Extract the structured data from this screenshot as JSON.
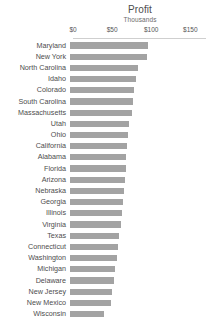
{
  "chart_data": {
    "type": "bar",
    "orientation": "horizontal",
    "title": "Profit",
    "subtitle": "Thousands",
    "xlabel": "",
    "ylabel": "",
    "xlim": [
      0,
      170
    ],
    "grid": false,
    "legend": null,
    "bar_color": "#a3a3a3",
    "axis_tick_labels": [
      "$0",
      "$50",
      "$100",
      "$150"
    ],
    "axis_tick_values": [
      0,
      50,
      100,
      150
    ],
    "value_prefix": "$",
    "value_unit": "Thousands",
    "categories": [
      "Maryland",
      "New York",
      "North Carolina",
      "Idaho",
      "Colorado",
      "South Carolina",
      "Massachusetts",
      "Utah",
      "Ohio",
      "California",
      "Alabama",
      "Florida",
      "Arizona",
      "Nebraska",
      "Georgia",
      "Illinois",
      "Virginia",
      "Texas",
      "Connecticut",
      "Washington",
      "Michigan",
      "Delaware",
      "New Jersey",
      "New Mexico",
      "Wisconsin"
    ],
    "values": [
      100,
      99,
      87,
      84,
      82,
      80,
      79,
      76,
      74,
      73,
      72,
      71,
      70,
      69,
      68,
      66,
      65,
      63,
      61,
      60,
      58,
      56,
      54,
      52,
      44
    ]
  }
}
